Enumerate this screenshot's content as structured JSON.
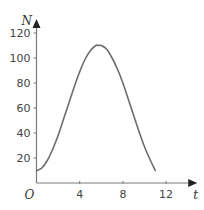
{
  "chart_data": {
    "type": "line",
    "title": "",
    "xlabel": "t",
    "ylabel": "N",
    "origin_label": "O",
    "xlim": [
      0,
      14.7
    ],
    "ylim": [
      0,
      128
    ],
    "x_ticks": [
      4,
      8,
      12
    ],
    "x_tick_labels": [
      "4",
      "8",
      "12"
    ],
    "y_ticks": [
      20,
      40,
      60,
      80,
      100,
      120
    ],
    "y_tick_labels": [
      "20",
      "40",
      "60",
      "80",
      "100",
      "120"
    ],
    "grid": false,
    "legend": "none",
    "series": [
      {
        "name": "N(t)",
        "x": [
          0,
          0.5,
          1,
          1.5,
          2,
          2.5,
          3,
          3.5,
          4,
          4.5,
          5,
          5.5,
          5.75,
          6,
          6.5,
          7,
          7.5,
          8,
          8.5,
          9,
          9.5,
          10,
          10.5,
          11
        ],
        "y": [
          10,
          12,
          18,
          27,
          38,
          51,
          64,
          77,
          89,
          99,
          106,
          110,
          110,
          110,
          107,
          100,
          91,
          80,
          67,
          54,
          41,
          29,
          19,
          10
        ]
      }
    ],
    "colors": {
      "curve": "#6d6d6d",
      "axis": "#7a7a7a",
      "text": "#444444"
    }
  }
}
